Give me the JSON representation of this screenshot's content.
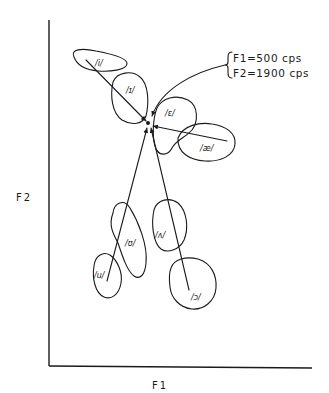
{
  "diagram": {
    "axes": {
      "y_label": "F2",
      "x_label": "F1"
    },
    "annotation": {
      "line1": "F1=500  cps",
      "line2": "F2=1900 cps"
    },
    "target_point": {
      "x": 148,
      "y": 122
    },
    "vowels": [
      {
        "id": "i",
        "label": "/i/"
      },
      {
        "id": "ih",
        "label": "/ɪ/"
      },
      {
        "id": "eh",
        "label": "/ɛ/"
      },
      {
        "id": "ae",
        "label": "/æ/"
      },
      {
        "id": "uh-hook",
        "label": "/ʊ/"
      },
      {
        "id": "u",
        "label": "/u/"
      },
      {
        "id": "wedge",
        "label": "/ʌ/"
      },
      {
        "id": "open-o",
        "label": "/ɔ/"
      }
    ]
  }
}
